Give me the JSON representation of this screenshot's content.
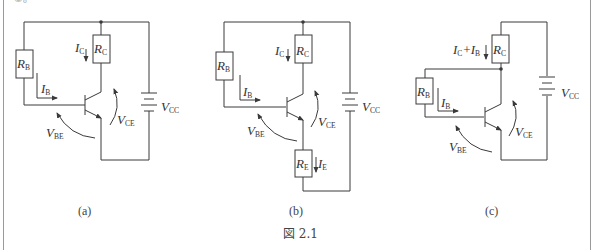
{
  "page_fragment": "②。",
  "figure_caption": "図 2.1",
  "circuits": [
    {
      "id": "a",
      "caption": "(a)",
      "labels": {
        "rb": {
          "main": "R",
          "sub": "B"
        },
        "rc": {
          "main": "R",
          "sub": "C"
        },
        "ic": {
          "main": "I",
          "sub": "C"
        },
        "ib": {
          "main": "I",
          "sub": "B"
        },
        "vbe": {
          "main": "V",
          "sub": "BE"
        },
        "vce": {
          "main": "V",
          "sub": "CE"
        },
        "vcc": {
          "main": "V",
          "sub": "CC"
        }
      }
    },
    {
      "id": "b",
      "caption": "(b)",
      "labels": {
        "rb": {
          "main": "R",
          "sub": "B"
        },
        "rc": {
          "main": "R",
          "sub": "C"
        },
        "re": {
          "main": "R",
          "sub": "E"
        },
        "ic": {
          "main": "I",
          "sub": "C"
        },
        "ib": {
          "main": "I",
          "sub": "B"
        },
        "ie": {
          "main": "I",
          "sub": "E"
        },
        "vbe": {
          "main": "V",
          "sub": "BE"
        },
        "vce": {
          "main": "V",
          "sub": "CE"
        },
        "vcc": {
          "main": "V",
          "sub": "CC"
        }
      }
    },
    {
      "id": "c",
      "caption": "(c)",
      "labels": {
        "rb": {
          "main": "R",
          "sub": "B"
        },
        "rc": {
          "main": "R",
          "sub": "C"
        },
        "icib": {
          "main1": "I",
          "sub1": "C",
          "plus": "+",
          "main2": "I",
          "sub2": "B"
        },
        "ib": {
          "main": "I",
          "sub": "B"
        },
        "vbe": {
          "main": "V",
          "sub": "BE"
        },
        "vce": {
          "main": "V",
          "sub": "CE"
        },
        "vcc": {
          "main": "V",
          "sub": "CC"
        }
      }
    }
  ]
}
